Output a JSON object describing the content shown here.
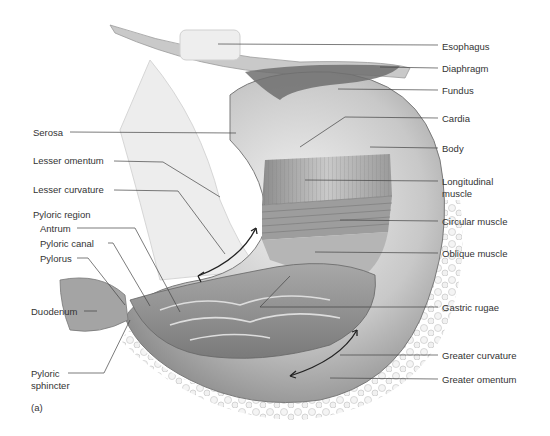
{
  "figure": {
    "panel_label": "(a)",
    "left_labels": [
      {
        "id": "serosa",
        "text": "Serosa",
        "x": 33,
        "y": 127
      },
      {
        "id": "lesser-omentum",
        "text": "Lesser omentum",
        "x": 33,
        "y": 155
      },
      {
        "id": "lesser-curvature",
        "text": "Lesser curvature",
        "x": 33,
        "y": 184
      },
      {
        "id": "pyloric-region",
        "text": "Pyloric region",
        "x": 33,
        "y": 209
      },
      {
        "id": "antrum",
        "text": "Antrum",
        "x": 40,
        "y": 223
      },
      {
        "id": "pyloric-canal",
        "text": "Pyloric canal",
        "x": 40,
        "y": 238
      },
      {
        "id": "pylorus",
        "text": "Pylorus",
        "x": 40,
        "y": 253
      },
      {
        "id": "duodenum",
        "text": "Duodenum",
        "x": 31,
        "y": 307
      },
      {
        "id": "pyloric-sphincter-1",
        "text": "Pyloric",
        "x": 31,
        "y": 368
      },
      {
        "id": "pyloric-sphincter-2",
        "text": "sphincter",
        "x": 31,
        "y": 380
      }
    ],
    "right_labels": [
      {
        "id": "esophagus",
        "text": "Esophagus",
        "y": 41
      },
      {
        "id": "diaphragm",
        "text": "Diaphragm",
        "y": 64
      },
      {
        "id": "fundus",
        "text": "Fundus",
        "y": 85
      },
      {
        "id": "cardia",
        "text": "Cardia",
        "y": 113
      },
      {
        "id": "body",
        "text": "Body",
        "y": 143
      },
      {
        "id": "longitudinal-muscle-1",
        "text": "Longitudinal",
        "y": 176
      },
      {
        "id": "longitudinal-muscle-2",
        "text": "muscle",
        "y": 188
      },
      {
        "id": "circular-muscle",
        "text": "Circular muscle",
        "y": 216
      },
      {
        "id": "oblique-muscle",
        "text": "Oblique muscle",
        "y": 248
      },
      {
        "id": "gastric-rugae",
        "text": "Gastric rugae",
        "y": 302
      },
      {
        "id": "greater-curvature",
        "text": "Greater curvature",
        "y": 350
      },
      {
        "id": "greater-omentum",
        "text": "Greater omentum",
        "y": 374
      }
    ],
    "colors": {
      "text": "#333333",
      "leader": "#444444",
      "tissue_dark": "#8a8a8a",
      "tissue_light": "#e6e6e6"
    }
  }
}
